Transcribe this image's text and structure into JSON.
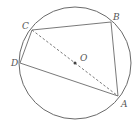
{
  "diagram": {
    "colors": {
      "stroke": "#6a6a6a",
      "label": "#555555",
      "background": "#ffffff"
    },
    "circle": {
      "center_label": "O",
      "cx": 75,
      "cy": 63,
      "r": 56
    },
    "points": {
      "A": {
        "label": "A",
        "x": 118,
        "y": 96,
        "lx": 123,
        "ly": 106
      },
      "B": {
        "label": "B",
        "x": 111,
        "y": 22,
        "lx": 114,
        "ly": 19
      },
      "C": {
        "label": "C",
        "x": 32,
        "y": 30,
        "lx": 22,
        "ly": 28
      },
      "D": {
        "label": "D",
        "x": 20,
        "y": 63,
        "lx": 11,
        "ly": 66
      },
      "O": {
        "label": "O",
        "x": 75,
        "y": 63,
        "lx": 80,
        "ly": 61
      }
    },
    "segments": [
      {
        "from": "A",
        "to": "B",
        "style": "solid"
      },
      {
        "from": "B",
        "to": "C",
        "style": "solid"
      },
      {
        "from": "C",
        "to": "D",
        "style": "solid"
      },
      {
        "from": "D",
        "to": "A",
        "style": "solid"
      },
      {
        "from": "C",
        "to": "A",
        "style": "dashed",
        "note": "diameter through O"
      }
    ]
  }
}
